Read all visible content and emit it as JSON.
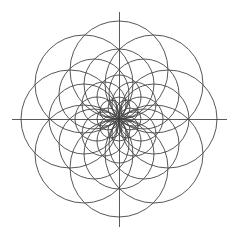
{
  "figure": {
    "kind": "geometric-line-diagram",
    "background_color": "#ffffff",
    "line_color": "#444444",
    "axis_color": "#5a5a5a",
    "canvas": {
      "width": 239,
      "height": 239
    }
  },
  "chart_data": {
    "type": "scatter",
    "xlabel": "",
    "ylabel": "",
    "grid": false,
    "legend": null,
    "center": {
      "x": 119,
      "y": 119
    },
    "axes": {
      "horizontal": {
        "x1": 12,
        "y1": 119,
        "x2": 227,
        "y2": 119
      },
      "vertical": {
        "x1": 119,
        "y1": 12,
        "x2": 119,
        "y2": 227
      }
    },
    "radii": [
      11,
      22,
      35,
      49
    ],
    "angles_deg": [
      0,
      45,
      90,
      135,
      180,
      225,
      270,
      315
    ],
    "circles": [
      {
        "cx": 119,
        "cy": 108,
        "r": 11,
        "angle_deg": 90,
        "ring": 1
      },
      {
        "cx": 127,
        "cy": 111,
        "r": 11,
        "angle_deg": 45,
        "ring": 1
      },
      {
        "cx": 130,
        "cy": 119,
        "r": 11,
        "angle_deg": 0,
        "ring": 1
      },
      {
        "cx": 127,
        "cy": 127,
        "r": 11,
        "angle_deg": 315,
        "ring": 1
      },
      {
        "cx": 119,
        "cy": 130,
        "r": 11,
        "angle_deg": 270,
        "ring": 1
      },
      {
        "cx": 111,
        "cy": 127,
        "r": 11,
        "angle_deg": 225,
        "ring": 1
      },
      {
        "cx": 108,
        "cy": 119,
        "r": 11,
        "angle_deg": 180,
        "ring": 1
      },
      {
        "cx": 111,
        "cy": 111,
        "r": 11,
        "angle_deg": 135,
        "ring": 1
      },
      {
        "cx": 119,
        "cy": 97,
        "r": 22,
        "angle_deg": 90,
        "ring": 2
      },
      {
        "cx": 134,
        "cy": 104,
        "r": 22,
        "angle_deg": 45,
        "ring": 2
      },
      {
        "cx": 141,
        "cy": 119,
        "r": 22,
        "angle_deg": 0,
        "ring": 2
      },
      {
        "cx": 134,
        "cy": 134,
        "r": 22,
        "angle_deg": 315,
        "ring": 2
      },
      {
        "cx": 119,
        "cy": 141,
        "r": 22,
        "angle_deg": 270,
        "ring": 2
      },
      {
        "cx": 104,
        "cy": 134,
        "r": 22,
        "angle_deg": 225,
        "ring": 2
      },
      {
        "cx": 97,
        "cy": 119,
        "r": 22,
        "angle_deg": 180,
        "ring": 2
      },
      {
        "cx": 104,
        "cy": 104,
        "r": 22,
        "angle_deg": 135,
        "ring": 2
      },
      {
        "cx": 119,
        "cy": 84,
        "r": 35,
        "angle_deg": 90,
        "ring": 3
      },
      {
        "cx": 144,
        "cy": 94,
        "r": 35,
        "angle_deg": 45,
        "ring": 3
      },
      {
        "cx": 154,
        "cy": 119,
        "r": 35,
        "angle_deg": 0,
        "ring": 3
      },
      {
        "cx": 144,
        "cy": 144,
        "r": 35,
        "angle_deg": 315,
        "ring": 3
      },
      {
        "cx": 119,
        "cy": 154,
        "r": 35,
        "angle_deg": 270,
        "ring": 3
      },
      {
        "cx": 94,
        "cy": 144,
        "r": 35,
        "angle_deg": 225,
        "ring": 3
      },
      {
        "cx": 84,
        "cy": 119,
        "r": 35,
        "angle_deg": 180,
        "ring": 3
      },
      {
        "cx": 94,
        "cy": 94,
        "r": 35,
        "angle_deg": 135,
        "ring": 3
      },
      {
        "cx": 119,
        "cy": 70,
        "r": 49,
        "angle_deg": 90,
        "ring": 4
      },
      {
        "cx": 154,
        "cy": 84,
        "r": 49,
        "angle_deg": 45,
        "ring": 4
      },
      {
        "cx": 168,
        "cy": 119,
        "r": 49,
        "angle_deg": 0,
        "ring": 4
      },
      {
        "cx": 154,
        "cy": 154,
        "r": 49,
        "angle_deg": 315,
        "ring": 4
      },
      {
        "cx": 119,
        "cy": 168,
        "r": 49,
        "angle_deg": 270,
        "ring": 4
      },
      {
        "cx": 84,
        "cy": 154,
        "r": 49,
        "angle_deg": 225,
        "ring": 4
      },
      {
        "cx": 70,
        "cy": 119,
        "r": 49,
        "angle_deg": 180,
        "ring": 4
      },
      {
        "cx": 84,
        "cy": 84,
        "r": 49,
        "angle_deg": 135,
        "ring": 4
      }
    ]
  }
}
